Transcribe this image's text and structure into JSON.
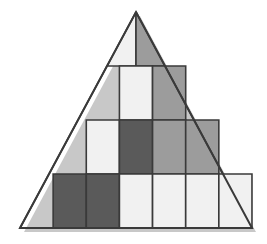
{
  "figure": {
    "name": "subdivided-triangle",
    "background_color": "#ffffff",
    "stroke_color": "#3a3a3a",
    "stroke_width": 1.6,
    "shadow_color": "#c8c8c8",
    "shadow_offset_x": 4,
    "shadow_offset_y": 4,
    "palette": {
      "light": "#f1f1f1",
      "mid": "#9c9c9c",
      "dark": "#5a5a5a"
    },
    "geometry": {
      "apex_x": 136,
      "apex_y": 12,
      "base_left_x": 20,
      "base_right_x": 252,
      "base_y": 228,
      "rows": 4,
      "row_height": 54,
      "columns": 7,
      "column_width": 33.14,
      "row_y": [
        12,
        66,
        120,
        174,
        228
      ]
    },
    "cells": [
      {
        "row": 1,
        "label": "row1-left-triangle",
        "shape": "triangle-left",
        "col": 3,
        "tone": "light"
      },
      {
        "row": 1,
        "label": "row1-right-triangle",
        "shape": "triangle-right",
        "col": 4,
        "tone": "mid"
      },
      {
        "row": 2,
        "label": "row2-left-triangle",
        "shape": "triangle-left",
        "col": 2,
        "tone": "dark"
      },
      {
        "row": 2,
        "label": "row2-cell-1",
        "shape": "square",
        "col": 3,
        "tone": "light"
      },
      {
        "row": 2,
        "label": "row2-cell-2",
        "shape": "square",
        "col": 4,
        "tone": "mid"
      },
      {
        "row": 2,
        "label": "row2-right-triangle",
        "shape": "triangle-right",
        "col": 5,
        "tone": "dark"
      },
      {
        "row": 3,
        "label": "row3-left-triangle",
        "shape": "triangle-left",
        "col": 1,
        "tone": "dark"
      },
      {
        "row": 3,
        "label": "row3-cell-1",
        "shape": "square",
        "col": 2,
        "tone": "light"
      },
      {
        "row": 3,
        "label": "row3-cell-2",
        "shape": "square",
        "col": 3,
        "tone": "dark"
      },
      {
        "row": 3,
        "label": "row3-cell-3",
        "shape": "square",
        "col": 4,
        "tone": "mid"
      },
      {
        "row": 3,
        "label": "row3-cell-4",
        "shape": "square",
        "col": 5,
        "tone": "mid"
      },
      {
        "row": 3,
        "label": "row3-right-triangle",
        "shape": "triangle-right",
        "col": 6,
        "tone": "dark"
      },
      {
        "row": 4,
        "label": "row4-left-triangle",
        "shape": "triangle-left",
        "col": 0,
        "tone": "dark"
      },
      {
        "row": 4,
        "label": "row4-cell-1",
        "shape": "square",
        "col": 1,
        "tone": "dark"
      },
      {
        "row": 4,
        "label": "row4-cell-2",
        "shape": "square",
        "col": 2,
        "tone": "dark"
      },
      {
        "row": 4,
        "label": "row4-cell-3",
        "shape": "square",
        "col": 3,
        "tone": "light"
      },
      {
        "row": 4,
        "label": "row4-cell-4",
        "shape": "square",
        "col": 4,
        "tone": "light"
      },
      {
        "row": 4,
        "label": "row4-cell-5",
        "shape": "square",
        "col": 5,
        "tone": "light"
      },
      {
        "row": 4,
        "label": "row4-cell-6",
        "shape": "square",
        "col": 6,
        "tone": "light"
      }
    ]
  }
}
